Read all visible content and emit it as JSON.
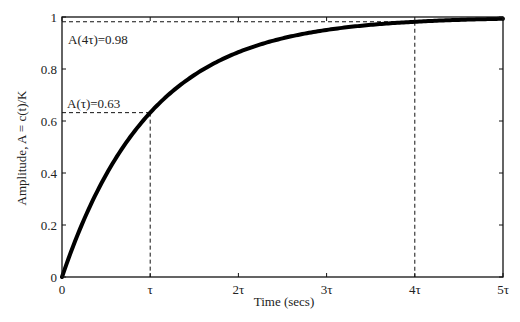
{
  "chart_data": {
    "type": "line",
    "title": "",
    "xlabel": "Time (secs)",
    "ylabel": "Amplitude, A = c(t)/K",
    "xlim": [
      0,
      5
    ],
    "ylim": [
      0,
      1
    ],
    "grid": false,
    "x_unit": "tau",
    "x_ticks": [
      0,
      1,
      2,
      3,
      4,
      5
    ],
    "x_tick_labels": [
      "0",
      "τ",
      "2τ",
      "3τ",
      "4τ",
      "5τ"
    ],
    "y_ticks": [
      0,
      0.2,
      0.4,
      0.6,
      0.8,
      1
    ],
    "y_tick_labels": [
      "0",
      "0.2",
      "0.4",
      "0.6",
      "0.8",
      "1"
    ],
    "series": [
      {
        "name": "c(t)/K = 1 - e^(-t/τ)",
        "x": [
          0,
          0.25,
          0.5,
          0.75,
          1,
          1.5,
          2,
          2.5,
          3,
          3.5,
          4,
          4.5,
          5
        ],
        "values": [
          0,
          0.22,
          0.39,
          0.53,
          0.63,
          0.78,
          0.86,
          0.92,
          0.95,
          0.97,
          0.98,
          0.99,
          0.99
        ]
      }
    ],
    "annotations": [
      {
        "text": "A(τ)=0.63",
        "x": 1,
        "y": 0.63
      },
      {
        "text": "A(4τ)=0.98",
        "x": 4,
        "y": 0.98
      }
    ]
  }
}
